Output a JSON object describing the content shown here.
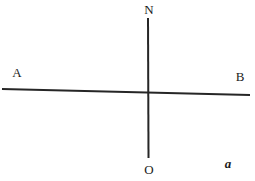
{
  "figure": {
    "panel_label": "a",
    "background_color": "#ffffff",
    "line_color": "#262626",
    "label_color": "#1b1b1b",
    "width": 255,
    "height": 181
  },
  "labels": {
    "north": "N",
    "left_end": "A",
    "right_end": "B",
    "origin_bottom": "O"
  },
  "chart_data": {
    "type": "diagram",
    "title": "",
    "xlabel": "",
    "ylabel": "",
    "axis_ranges": {
      "x": [
        0,
        255
      ],
      "y": [
        0,
        181
      ]
    },
    "grid": false,
    "legend": "none",
    "lines": [
      {
        "name": "line-AB",
        "from_label": "A",
        "to_label": "B",
        "x1": 2,
        "y1": 89,
        "x2": 250,
        "y2": 95,
        "stroke_width": 2.0,
        "color": "#262626"
      },
      {
        "name": "line-NO",
        "from_label": "N",
        "to_label": "O",
        "x1": 148,
        "y1": 18,
        "x2": 148.5,
        "y2": 158,
        "stroke_width": 2.0,
        "color": "#262626"
      }
    ],
    "intersection": {
      "x": 148,
      "y": 93
    },
    "annotations": [
      {
        "text": "N",
        "x": 149,
        "y": 9,
        "style": "serif-regular"
      },
      {
        "text": "A",
        "x": 17,
        "y": 72,
        "style": "serif-regular"
      },
      {
        "text": "B",
        "x": 240,
        "y": 76,
        "style": "serif-regular"
      },
      {
        "text": "O",
        "x": 149,
        "y": 169,
        "style": "serif-regular"
      },
      {
        "text": "a",
        "x": 228,
        "y": 163,
        "style": "serif-bold-italic"
      }
    ]
  }
}
